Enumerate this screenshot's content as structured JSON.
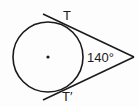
{
  "diagram": {
    "type": "circle-with-two-tangents",
    "labels": {
      "top_tangent_point": "T",
      "bottom_tangent_point": "T′",
      "arc_measure": "140°"
    },
    "colors": {
      "stroke": "#1a1a1a",
      "background": "#fdfdfd"
    }
  }
}
